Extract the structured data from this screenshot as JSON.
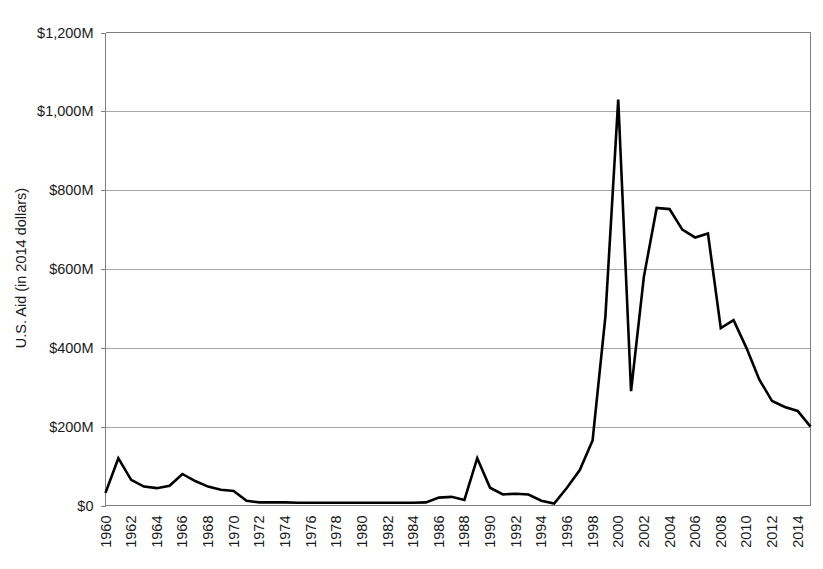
{
  "chart_data": {
    "type": "line",
    "title": "",
    "xlabel": "",
    "ylabel": "U.S. Aid (in 2014 dollars)",
    "xlim": [
      1960,
      2015
    ],
    "ylim": [
      0,
      1200
    ],
    "y_unit": "millions of 2014 dollars",
    "grid": "horizontal",
    "legend": "none",
    "y_ticks": [
      0,
      200,
      400,
      600,
      800,
      1000,
      1200
    ],
    "y_tick_labels": [
      "$0",
      "$200M",
      "$400M",
      "$600M",
      "$800M",
      "$1,000M",
      "$1,200M"
    ],
    "x_ticks": [
      1960,
      1962,
      1964,
      1966,
      1968,
      1970,
      1972,
      1974,
      1976,
      1978,
      1980,
      1982,
      1984,
      1986,
      1988,
      1990,
      1992,
      1994,
      1996,
      1998,
      2000,
      2002,
      2004,
      2006,
      2008,
      2010,
      2012,
      2014
    ],
    "x_tick_labels": [
      "1960",
      "1962",
      "1964",
      "1966",
      "1968",
      "1970",
      "1972",
      "1974",
      "1976",
      "1978",
      "1980",
      "1982",
      "1984",
      "1986",
      "1988",
      "1990",
      "1992",
      "1994",
      "1996",
      "1998",
      "2000",
      "2002",
      "2004",
      "2006",
      "2008",
      "2010",
      "2012",
      "2014"
    ],
    "x": [
      1960,
      1961,
      1962,
      1963,
      1964,
      1965,
      1966,
      1967,
      1968,
      1969,
      1970,
      1971,
      1972,
      1973,
      1974,
      1975,
      1976,
      1977,
      1978,
      1979,
      1980,
      1981,
      1982,
      1983,
      1984,
      1985,
      1986,
      1987,
      1988,
      1989,
      1990,
      1991,
      1992,
      1993,
      1994,
      1995,
      1996,
      1997,
      1998,
      1999,
      2000,
      2001,
      2002,
      2003,
      2004,
      2005,
      2006,
      2007,
      2008,
      2009,
      2010,
      2011,
      2012,
      2013,
      2014,
      2015
    ],
    "values": [
      32,
      120,
      65,
      48,
      44,
      50,
      80,
      62,
      48,
      40,
      37,
      12,
      8,
      8,
      8,
      7,
      7,
      7,
      7,
      7,
      7,
      7,
      7,
      7,
      7,
      8,
      20,
      22,
      14,
      120,
      45,
      28,
      30,
      28,
      12,
      5,
      45,
      90,
      165,
      480,
      1030,
      290,
      580,
      755,
      752,
      700,
      680,
      690,
      450,
      470,
      400,
      320,
      265,
      250,
      240,
      200
    ],
    "series_name": "U.S. Aid",
    "line_color": "#000000",
    "annotations": []
  },
  "axes": {
    "y_axis_title": "U.S. Aid (in 2014 dollars)"
  }
}
